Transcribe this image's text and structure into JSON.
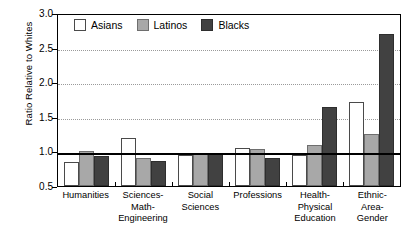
{
  "chart_data": {
    "type": "bar",
    "title": "",
    "subtitle": "",
    "xlabel": "",
    "ylabel": "Ratio Relative to Whites",
    "ylim": [
      0.5,
      3.0
    ],
    "yticks": [
      "0.5",
      "1.0",
      "1.5",
      "2.0",
      "2.5",
      "3.0"
    ],
    "ytick_values": [
      0.5,
      1.0,
      1.5,
      2.0,
      2.5,
      3.0
    ],
    "grid": true,
    "gridlines_at": [
      1.5,
      2.0,
      2.5
    ],
    "reference_line": 1.0,
    "legend_position": "top-left",
    "categories": [
      "Humanities",
      "Sciences-\nMath-\nEngineering",
      "Social\nSciences",
      "Professions",
      "Health-\nPhysical\nEducation",
      "Ethnic-\nArea-\nGender"
    ],
    "series": [
      {
        "name": "Asians",
        "color": "#ffffff",
        "values": [
          0.84,
          1.19,
          0.95,
          1.05,
          0.95,
          1.71
        ]
      },
      {
        "name": "Latinos",
        "color": "#a8a8a8",
        "values": [
          1.0,
          0.9,
          0.97,
          1.03,
          1.09,
          1.25
        ]
      },
      {
        "name": "Blacks",
        "color": "#414141",
        "values": [
          0.93,
          0.86,
          0.98,
          0.91,
          1.64,
          2.69
        ]
      }
    ]
  },
  "legend": {
    "entries": [
      {
        "label": "Asians"
      },
      {
        "label": "Latinos"
      },
      {
        "label": "Blacks"
      }
    ]
  },
  "axes": {
    "y_title": "Ratio Relative to Whites"
  }
}
